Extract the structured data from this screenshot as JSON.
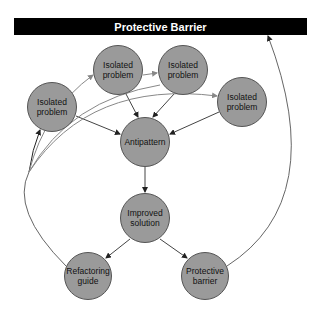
{
  "header": {
    "title": "Protective Barrier"
  },
  "nodes": [
    {
      "id": "iso1",
      "label": "Isolated\nproblem",
      "cx": 52,
      "cy": 107,
      "r": 25
    },
    {
      "id": "iso2",
      "label": "Isolated\nproblem",
      "cx": 118,
      "cy": 70,
      "r": 25
    },
    {
      "id": "iso3",
      "label": "Isolated\nproblem",
      "cx": 183,
      "cy": 70,
      "r": 25
    },
    {
      "id": "iso4",
      "label": "Isolated\nproblem",
      "cx": 242,
      "cy": 102,
      "r": 25
    },
    {
      "id": "anti",
      "label": "Antipattern",
      "cx": 145,
      "cy": 142,
      "r": 25
    },
    {
      "id": "impr",
      "label": "Improved\nsolution",
      "cx": 145,
      "cy": 218,
      "r": 25
    },
    {
      "id": "refa",
      "label": "Refactoring\nguide",
      "cx": 88,
      "cy": 276,
      "r": 24
    },
    {
      "id": "prot",
      "label": "Protective\nbarrier",
      "cx": 205,
      "cy": 276,
      "r": 24
    }
  ],
  "colors": {
    "node_fill": "#9a9a9a",
    "bar": "#000000",
    "edge": "#444444",
    "curve": "#888888"
  }
}
